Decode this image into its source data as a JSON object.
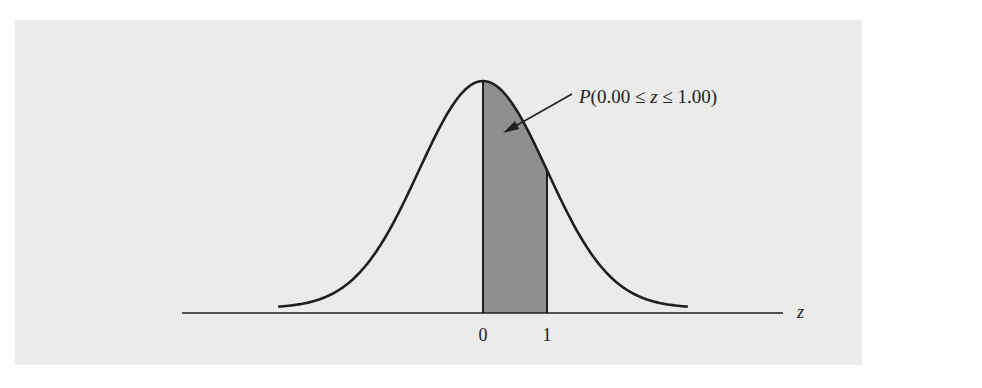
{
  "chart_data": {
    "type": "area",
    "title": "",
    "xlabel": "z",
    "ylabel": "",
    "x_ticks": [
      "0",
      "1"
    ],
    "xlim": [
      -3.2,
      3.2
    ],
    "shaded_region": {
      "from": 0.0,
      "to": 1.0,
      "color": "#8f8f8f"
    },
    "annotation": {
      "text": "P(0.00 ≤ z ≤ 1.00)",
      "points_to": "shaded region"
    },
    "grid": false,
    "legend": "none"
  },
  "colors": {
    "background": "#ebebea",
    "curve": "#1f1f1f",
    "shade": "#8f8f8f"
  },
  "labels": {
    "annotation": "P(0.00 ≤ z ≤ 1.00)",
    "axis_var": "z",
    "tick0": "0",
    "tick1": "1"
  }
}
